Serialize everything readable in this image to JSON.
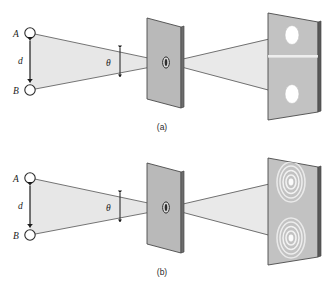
{
  "figure": {
    "kind": "optics-diagram",
    "title_visible": false,
    "background_color": "#ffffff",
    "ink_color": "#1c1c1c",
    "plate_fill": "#b9b9b9",
    "plate_edge_fill": "#6d6d6d",
    "screen_fill": "#c2c2c2",
    "beam_fill": "#e4e4e4",
    "spot_fill": "#ffffff",
    "ring_color": "#f2f2f2"
  },
  "panels": [
    {
      "id": "a",
      "caption": "(a)",
      "source_labels": {
        "top": "A",
        "bottom": "B"
      },
      "separation_label": "d",
      "angle_label": "θ",
      "screen_pattern": "two-sharp-spots",
      "spot_count": 2
    },
    {
      "id": "b",
      "caption": "(b)",
      "source_labels": {
        "top": "A",
        "bottom": "B"
      },
      "separation_label": "d",
      "angle_label": "θ",
      "screen_pattern": "two-overlapping-diffraction-ring-sets",
      "spot_count": 2,
      "ring_count_per_spot": 4
    }
  ]
}
